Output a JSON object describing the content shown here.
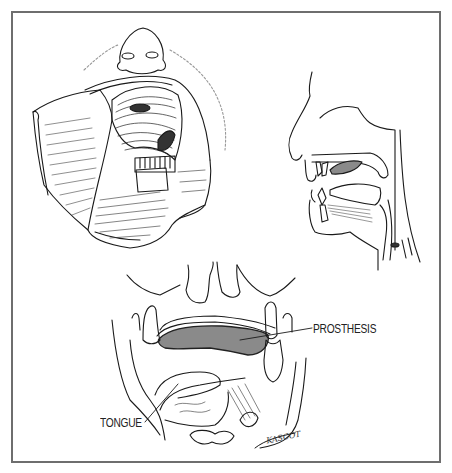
{
  "figure": {
    "panels": [
      {
        "id": "open-mouth-view",
        "description": "Frontal view of open mouth with resected palate, retracted cheek flap"
      },
      {
        "id": "sagittal-view",
        "description": "Sagittal cross-section of head showing palatal prosthesis in place"
      },
      {
        "id": "coronal-view",
        "description": "Coronal cross-section showing prosthesis and tongue"
      }
    ],
    "labels": {
      "prosthesis": "PROSTHESIS",
      "tongue": "TONGUE"
    },
    "signature": "KASCOT",
    "colors": {
      "border": "#6e6e6e",
      "line": "#1a1a1a",
      "prosthesis_fill": "#8a8a8a",
      "background": "#ffffff"
    }
  }
}
